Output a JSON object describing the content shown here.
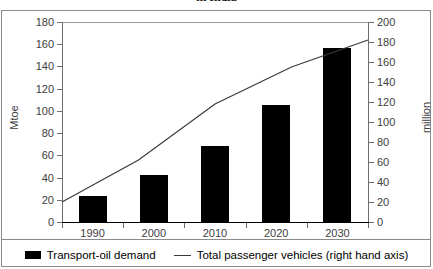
{
  "chart_data": {
    "type": "bar",
    "title": "in India",
    "categories": [
      "1990",
      "2000",
      "2010",
      "2020",
      "2030"
    ],
    "series": [
      {
        "name": "Transport-oil demand",
        "type": "bar",
        "axis": "left",
        "values": [
          23,
          42,
          68,
          105,
          157
        ]
      },
      {
        "name": "Total passenger vehicles (right hand axis)",
        "type": "line",
        "axis": "right",
        "values": [
          20,
          62,
          118,
          155,
          182
        ]
      }
    ],
    "xlabel": "",
    "ylabel": "Mtoe",
    "ylabel_right": "million",
    "ylim": [
      0,
      180
    ],
    "ylim_right": [
      0,
      200
    ],
    "yticks": [
      "0",
      "20",
      "40",
      "60",
      "80",
      "100",
      "120",
      "140",
      "160",
      "180"
    ],
    "yticks_right": [
      "0",
      "20",
      "40",
      "60",
      "80",
      "100",
      "120",
      "140",
      "160",
      "180",
      "200"
    ],
    "grid": false,
    "legend_position": "bottom",
    "colors": {
      "bar": "#000000",
      "line": "#3a3a3a",
      "axis": "#6e6e6e",
      "text": "#3d3d3d",
      "background": "#ffffff"
    }
  },
  "legend": {
    "items": [
      {
        "label": "Transport-oil demand",
        "marker": "bar-swatch"
      },
      {
        "label": "Total passenger vehicles (right hand axis)",
        "marker": "line-swatch"
      }
    ]
  }
}
